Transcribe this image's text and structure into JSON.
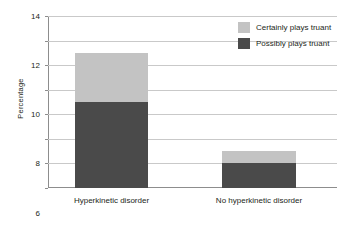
{
  "chart_data": {
    "type": "bar",
    "subtype": "stacked-bar",
    "title": "",
    "xlabel": "",
    "ylabel": "Percentage",
    "ylim": [
      0,
      14
    ],
    "ytick_step": 2,
    "yticks": [
      0,
      2,
      4,
      6,
      8,
      10,
      12,
      14
    ],
    "ytick_labels": [
      "0",
      "2",
      "4",
      "6",
      "8",
      "10",
      "12",
      "14"
    ],
    "grid": true,
    "grid_axis": "y",
    "legend_position": "top-right",
    "categories": [
      "Hyperkinetic disorder",
      "No hyperkinetic disorder"
    ],
    "series": [
      {
        "name": "Possibly plays truant",
        "color": "#4a4a4a",
        "values": [
          7,
          2
        ]
      },
      {
        "name": "Certainly plays truant",
        "color": "#c3c3c3",
        "values": [
          4,
          1
        ]
      }
    ],
    "stack_totals": [
      11,
      3
    ]
  },
  "legend": {
    "items": [
      {
        "label": "Certainly plays truant",
        "color": "#c3c3c3"
      },
      {
        "label": "Possibly plays truant",
        "color": "#4a4a4a"
      }
    ]
  },
  "colors": {
    "certainly": "#c3c3c3",
    "possibly": "#4a4a4a",
    "axis": "#8d8d8d",
    "grid": "#c9c9c9",
    "text": "#231f20",
    "background": "#ffffff"
  }
}
